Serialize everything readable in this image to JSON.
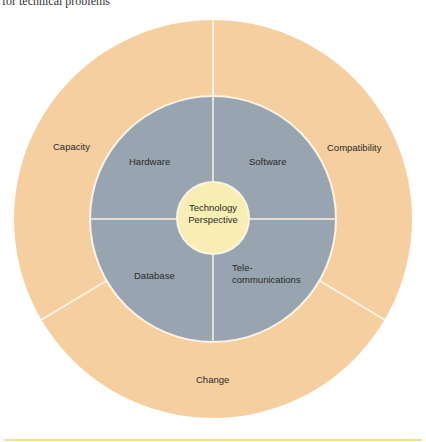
{
  "caption": "for technical problems",
  "colors": {
    "outer_ring": "#f6cfa0",
    "inner_ring": "#98a4b0",
    "center": "#f8eeb4",
    "divider": "#fbf3e6",
    "rule": "#f4e08a"
  },
  "diagram": {
    "center_label": [
      "Technology",
      "Perspective"
    ],
    "inner_segments": [
      {
        "label": "Hardware"
      },
      {
        "label": "Software"
      },
      {
        "label": "Database"
      },
      {
        "label_line1": "Tele-",
        "label_line2": "communications"
      }
    ],
    "outer_segments": [
      {
        "label": "Capacity"
      },
      {
        "label": "Compatibility"
      },
      {
        "label": "Change"
      }
    ]
  }
}
